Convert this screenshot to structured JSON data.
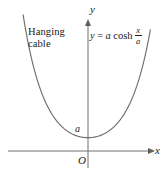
{
  "figure": {
    "caption_absent": true,
    "background_color": "#ffffff",
    "curve_color": "#6e6e6e",
    "axis_color": "#6e6e6e",
    "text_color": "#1a1a1a",
    "annotation": {
      "line1": "Hanging",
      "line2": "cable"
    },
    "equation": {
      "lhs": "y",
      "equals": "=",
      "coefficient": "a",
      "function": "cosh",
      "fraction_numerator": "x",
      "fraction_denominator": "a",
      "plain_text": "y = a cosh x/a"
    },
    "axes": {
      "y_label": "y",
      "x_label": "x",
      "origin_label": "O",
      "y_intercept_label": "a"
    }
  },
  "chart_data": {
    "type": "line",
    "title": "",
    "subtitle": "",
    "xlabel": "x",
    "ylabel": "y",
    "legend": [],
    "grid": false,
    "annotations": [
      "Hanging cable",
      "y = a cosh x/a",
      "O",
      "a"
    ],
    "axis_arrows": {
      "x_positive": true,
      "y_positive": true
    },
    "xlim": [
      -3.2,
      3.0
    ],
    "ylim": [
      -0.35,
      10.4
    ],
    "function": "y = a*cosh(x/a)",
    "parameter_a": 1,
    "y_intercept": 1,
    "series": [
      {
        "name": "catenary",
        "x": [
          -3.2,
          -2.9,
          -2.6,
          -2.3,
          -2.0,
          -1.7,
          -1.4,
          -1.1,
          -0.8,
          -0.5,
          -0.2,
          0.0,
          0.2,
          0.5,
          0.8,
          1.1,
          1.4,
          1.7,
          2.0,
          2.3,
          2.6,
          2.9
        ],
        "y": [
          12.29,
          9.12,
          6.77,
          5.04,
          3.76,
          2.83,
          2.15,
          1.67,
          1.34,
          1.13,
          1.02,
          1.0,
          1.02,
          1.13,
          1.34,
          1.67,
          2.15,
          2.83,
          3.76,
          5.04,
          6.77,
          9.12
        ]
      }
    ]
  }
}
